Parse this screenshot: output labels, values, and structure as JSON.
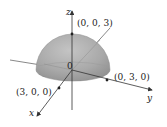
{
  "figure": {
    "type": "hemisphere",
    "radius": 3,
    "colors": {
      "surface": "#a9a9a9",
      "surface_light": "#c4c4c4",
      "surface_dark": "#8e8e8e",
      "axis": "#333333",
      "text": "#222222",
      "background": "#ffffff"
    },
    "axes": {
      "x_label": "x",
      "y_label": "y",
      "z_label": "z"
    },
    "origin_label": "0",
    "points": [
      {
        "label": "(0, 0, 3)",
        "coords": [
          0,
          0,
          3
        ]
      },
      {
        "label": "(0, 3, 0)",
        "coords": [
          0,
          3,
          0
        ]
      },
      {
        "label": "(3, 0, 0)",
        "coords": [
          3,
          0,
          0
        ]
      }
    ]
  }
}
